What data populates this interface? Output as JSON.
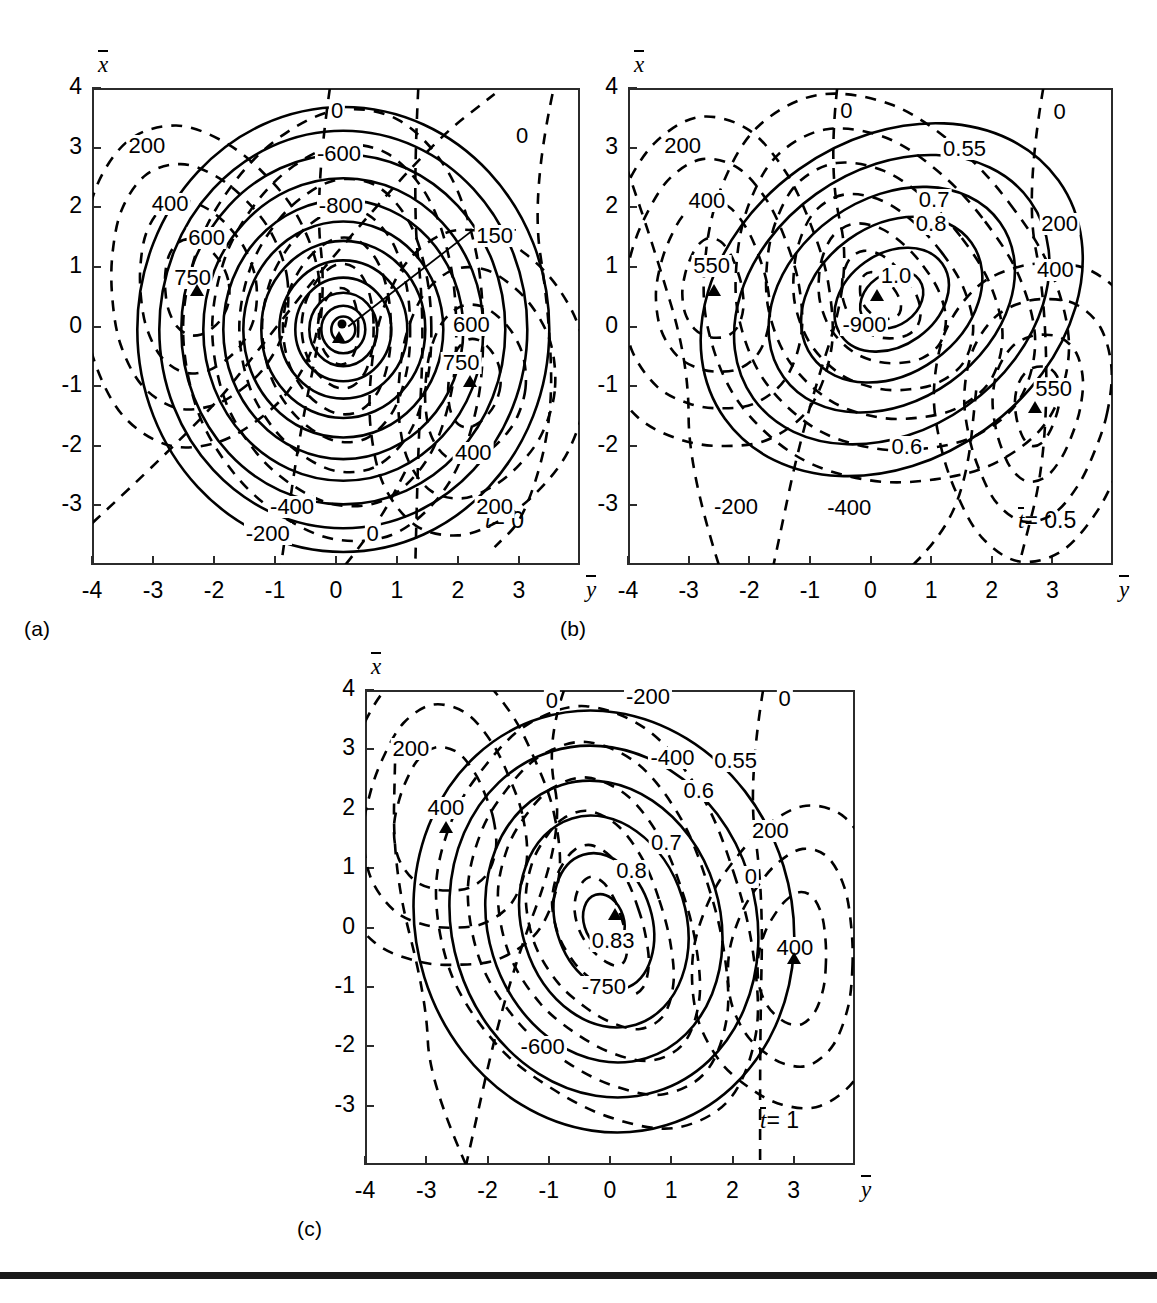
{
  "figure": {
    "type": "contour-plot-figure",
    "panel_count": 3,
    "x_axis_name": "y",
    "y_axis_name": "x",
    "x_ticks": [
      "-4",
      "-3",
      "-2",
      "-1",
      "0",
      "1",
      "2",
      "3"
    ],
    "y_ticks": [
      "4",
      "3",
      "2",
      "1",
      "0",
      "-1",
      "-2",
      "-3"
    ],
    "xlim": [
      -4,
      4
    ],
    "ylim": [
      -4,
      4
    ]
  },
  "panels": [
    {
      "letter": "(a)",
      "time_label_prefix": "t",
      "time_label_value": "= 0",
      "time_value": 0,
      "labels": [
        {
          "text": "0",
          "x": 0.02,
          "y": 3.62
        },
        {
          "text": "0",
          "x": 3.05,
          "y": 3.2
        },
        {
          "text": "200",
          "x": -3.1,
          "y": 3.02
        },
        {
          "text": "-600",
          "x": 0.05,
          "y": 2.9
        },
        {
          "text": "400",
          "x": -2.72,
          "y": 2.05
        },
        {
          "text": "-800",
          "x": 0.08,
          "y": 2.02
        },
        {
          "text": "600",
          "x": -2.12,
          "y": 1.48
        },
        {
          "text": "150",
          "x": 2.6,
          "y": 1.52
        },
        {
          "text": "750",
          "x": -2.35,
          "y": 0.82
        },
        {
          "text": "600",
          "x": 2.22,
          "y": 0.02
        },
        {
          "text": "750",
          "x": 2.05,
          "y": -0.62
        },
        {
          "text": "400",
          "x": 2.25,
          "y": -2.12
        },
        {
          "text": "-400",
          "x": -0.72,
          "y": -3.02
        },
        {
          "text": "200",
          "x": 2.6,
          "y": -3.02
        },
        {
          "text": "-200",
          "x": -1.12,
          "y": -3.48
        },
        {
          "text": "0",
          "x": 0.6,
          "y": -3.48
        }
      ],
      "markers": [
        {
          "type": "triangle",
          "x": -2.28,
          "y": 0.62
        },
        {
          "type": "triangle",
          "x": 0.05,
          "y": -0.18
        },
        {
          "type": "dot",
          "x": 0.1,
          "y": 0.05
        },
        {
          "type": "triangle",
          "x": 2.2,
          "y": -0.92
        }
      ]
    },
    {
      "letter": "(b)",
      "time_label_prefix": "t",
      "time_label_value": "= 0.5",
      "time_value": 0.5,
      "labels": [
        {
          "text": "0",
          "x": -0.4,
          "y": 3.62
        },
        {
          "text": "0",
          "x": 3.12,
          "y": 3.6
        },
        {
          "text": "200",
          "x": -3.1,
          "y": 3.02
        },
        {
          "text": "0.55",
          "x": 1.55,
          "y": 2.98
        },
        {
          "text": "400",
          "x": -2.7,
          "y": 2.1
        },
        {
          "text": "0.7",
          "x": 1.05,
          "y": 2.12
        },
        {
          "text": "0.8",
          "x": 1.0,
          "y": 1.72
        },
        {
          "text": "200",
          "x": 3.12,
          "y": 1.72
        },
        {
          "text": "550",
          "x": -2.62,
          "y": 1.02
        },
        {
          "text": "1.0",
          "x": 0.42,
          "y": 0.85
        },
        {
          "text": "400",
          "x": 3.05,
          "y": 0.95
        },
        {
          "text": "-900",
          "x": -0.1,
          "y": 0.02
        },
        {
          "text": "550",
          "x": 3.02,
          "y": -1.05
        },
        {
          "text": "0.6",
          "x": 0.6,
          "y": -2.02
        },
        {
          "text": "-200",
          "x": -2.22,
          "y": -3.02
        },
        {
          "text": "-400",
          "x": -0.35,
          "y": -3.05
        }
      ],
      "markers": [
        {
          "type": "triangle",
          "x": -2.58,
          "y": 0.62
        },
        {
          "type": "triangle",
          "x": 0.1,
          "y": 0.52
        },
        {
          "type": "triangle",
          "x": 2.72,
          "y": -1.35
        }
      ]
    },
    {
      "letter": "(c)",
      "time_label_prefix": "t",
      "time_label_value": "= 1",
      "time_value": 1,
      "labels": [
        {
          "text": "0",
          "x": -0.95,
          "y": 3.82
        },
        {
          "text": "-200",
          "x": 0.62,
          "y": 3.88
        },
        {
          "text": "0",
          "x": 2.85,
          "y": 3.85
        },
        {
          "text": "200",
          "x": -3.25,
          "y": 3.0
        },
        {
          "text": "-400",
          "x": 1.02,
          "y": 2.85
        },
        {
          "text": "0.55",
          "x": 2.05,
          "y": 2.8
        },
        {
          "text": "400",
          "x": -2.68,
          "y": 2.02
        },
        {
          "text": "0.6",
          "x": 1.45,
          "y": 2.3
        },
        {
          "text": "0.7",
          "x": 0.92,
          "y": 1.42
        },
        {
          "text": "200",
          "x": 2.62,
          "y": 1.62
        },
        {
          "text": "0.8",
          "x": 0.35,
          "y": 0.95
        },
        {
          "text": "0",
          "x": 2.3,
          "y": 0.85
        },
        {
          "text": "0.83",
          "x": 0.05,
          "y": -0.22
        },
        {
          "text": "400",
          "x": 3.02,
          "y": -0.35
        },
        {
          "text": "-750",
          "x": -0.1,
          "y": -1.0
        },
        {
          "text": "-600",
          "x": -1.1,
          "y": -2.02
        }
      ],
      "markers": [
        {
          "type": "triangle",
          "x": -2.68,
          "y": 1.7
        },
        {
          "type": "triangle",
          "x": 0.08,
          "y": 0.22
        },
        {
          "type": "triangle",
          "x": 3.0,
          "y": -0.52
        }
      ]
    }
  ],
  "chart_data": {
    "type": "contour",
    "title": "",
    "xlabel": "y",
    "ylabel": "x",
    "xlim": [
      -4,
      4
    ],
    "ylim": [
      -4,
      4
    ],
    "grid": false,
    "legend": "none",
    "line_styles": {
      "dashed": "streamfunction / pressure contours",
      "solid": "normalized amplitude contours"
    },
    "panels": [
      {
        "label": "(a)",
        "parameter": "t = 0",
        "dashed_levels": [
          -800,
          -600,
          -400,
          -200,
          0,
          150,
          200,
          400,
          600,
          750
        ],
        "solid_levels": [
          "unlabeled concentric set"
        ],
        "extrema": [
          {
            "value": 750,
            "x": -2.28,
            "y": 0.62,
            "kind": "max"
          },
          {
            "value": 750,
            "x": 2.2,
            "y": -0.92,
            "kind": "max"
          },
          {
            "value": "center",
            "x": 0.05,
            "y": -0.18,
            "kind": "core"
          }
        ]
      },
      {
        "label": "(b)",
        "parameter": "t = 0.5",
        "dashed_levels": [
          -900,
          -400,
          -200,
          0,
          200,
          400,
          550
        ],
        "solid_levels": [
          0.55,
          0.6,
          0.7,
          0.8,
          1.0
        ],
        "extrema": [
          {
            "value": 550,
            "x": -2.58,
            "y": 0.62,
            "kind": "max"
          },
          {
            "value": -900,
            "x": 0.1,
            "y": 0.52,
            "kind": "min"
          },
          {
            "value": 550,
            "x": 2.72,
            "y": -1.35,
            "kind": "max"
          }
        ]
      },
      {
        "label": "(c)",
        "parameter": "t = 1",
        "dashed_levels": [
          -750,
          -600,
          -400,
          -200,
          0,
          200,
          400
        ],
        "solid_levels": [
          0.55,
          0.6,
          0.7,
          0.8,
          0.83
        ],
        "extrema": [
          {
            "value": 400,
            "x": -2.68,
            "y": 1.7,
            "kind": "max"
          },
          {
            "value": 0.83,
            "x": 0.08,
            "y": 0.22,
            "kind": "max"
          },
          {
            "value": 400,
            "x": 3.0,
            "y": -0.52,
            "kind": "max"
          }
        ]
      }
    ]
  }
}
